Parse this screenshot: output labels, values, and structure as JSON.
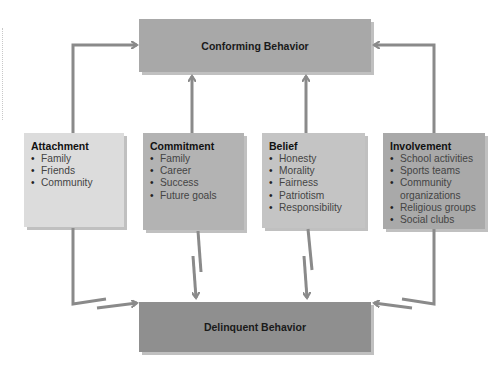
{
  "diagram": {
    "top_outcome": {
      "label": "Conforming Behavior",
      "color": "#a8a8a8"
    },
    "bottom_outcome": {
      "label": "Delinquent Behavior",
      "color": "#8f8f8f"
    },
    "bonds": [
      {
        "title": "Attachment",
        "color": "#dcdcdc",
        "items": [
          "Family",
          "Friends",
          "Community"
        ]
      },
      {
        "title": "Commitment",
        "color": "#b3b3b3",
        "items": [
          "Family",
          "Career",
          "Success",
          "Future goals"
        ]
      },
      {
        "title": "Belief",
        "color": "#c4c4c4",
        "items": [
          "Honesty",
          "Morality",
          "Fairness",
          "Patriotism",
          "Responsibility"
        ]
      },
      {
        "title": "Involvement",
        "color": "#a9a9a9",
        "items": [
          "School activities",
          "Sports teams",
          "Community organizations",
          "Religious groups",
          "Social clubs"
        ]
      }
    ],
    "arrow_color": "#8a8a8a"
  }
}
